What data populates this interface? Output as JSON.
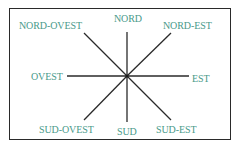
{
  "diagram": {
    "type": "compass-rose",
    "text_color": "#4a9a8a",
    "line_color": "#2a2a2a",
    "labels": {
      "nord": "NORD",
      "nord_est": "NORD-EST",
      "est": "EST",
      "sud_est": "SUD-EST",
      "sud": "SUD",
      "sud_ovest": "SUD-OVEST",
      "ovest": "OVEST",
      "nord_ovest": "NORD-OVEST"
    }
  }
}
